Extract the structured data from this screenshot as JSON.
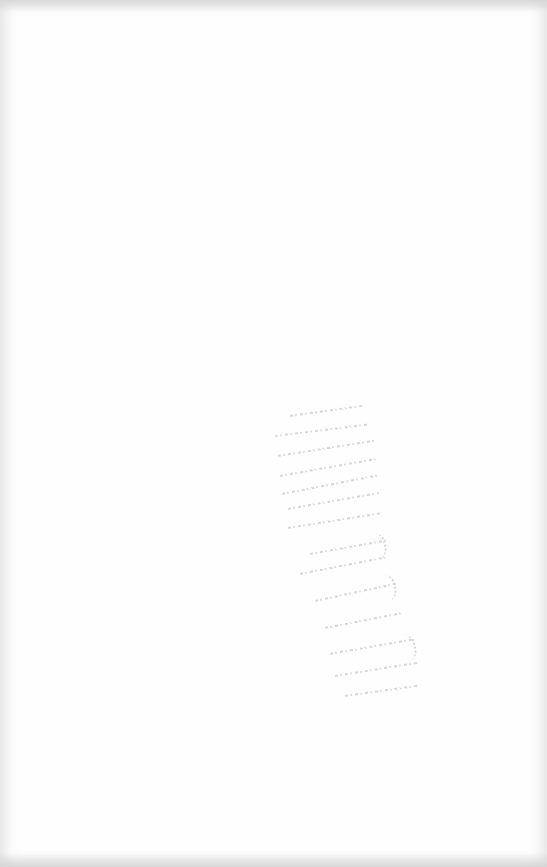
{
  "document": {
    "type": "scanned-page",
    "background_color": "#fefefe",
    "edge_shade_color": "#cdcdcd",
    "showthrough_color": "#b9b9b9",
    "text_blocks": []
  }
}
